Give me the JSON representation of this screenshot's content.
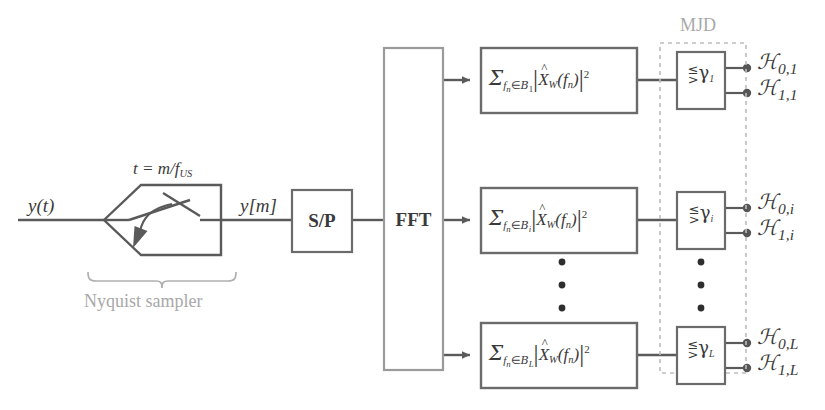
{
  "diagram": {
    "colors": {
      "line": "#5a5a5a",
      "box_border": "#6b6b6b",
      "text": "#3a3a3a",
      "gray_label": "#a8a8a8",
      "dashed_border": "#bdbdbd",
      "background": "#ffffff"
    }
  },
  "input": {
    "signal_label": "y(t)",
    "sampled_label": "y[m]",
    "sampling_relation": "t = m/f",
    "sampling_relation_sub": "US",
    "bracket_label": "Nyquist sampler"
  },
  "blocks": {
    "sp": "S/P",
    "fft": "FFT"
  },
  "mjd": {
    "label": "MJD"
  },
  "branches": [
    {
      "id": "branch-1",
      "index_symbol": "1",
      "energy": {
        "sigma": "Σ",
        "sum_var": "f",
        "sum_var_sub": "n",
        "member": "∈",
        "band_set": "B",
        "band_sub": "1",
        "magnitude_open": "|",
        "spectrum": "X",
        "spectrum_hat": "̂",
        "spectrum_sub": "W",
        "arg_open": "(",
        "arg": "f",
        "arg_sub": "n",
        "arg_close": ")",
        "magnitude_close": "|",
        "exponent": "2"
      },
      "threshold": {
        "cmp_top": "≤",
        "cmp_bottom": ">",
        "gamma": "γ",
        "gamma_sub": "1"
      },
      "outputs": [
        {
          "symbol": "ℋ",
          "sub": "0,1"
        },
        {
          "symbol": "ℋ",
          "sub": "1,1"
        }
      ]
    },
    {
      "id": "branch-i",
      "index_symbol": "i",
      "energy": {
        "sigma": "Σ",
        "sum_var": "f",
        "sum_var_sub": "n",
        "member": "∈",
        "band_set": "B",
        "band_sub": "i",
        "magnitude_open": "|",
        "spectrum": "X",
        "spectrum_hat": "̂",
        "spectrum_sub": "W",
        "arg_open": "(",
        "arg": "f",
        "arg_sub": "n",
        "arg_close": ")",
        "magnitude_close": "|",
        "exponent": "2"
      },
      "threshold": {
        "cmp_top": "≤",
        "cmp_bottom": ">",
        "gamma": "γ",
        "gamma_sub": "i"
      },
      "outputs": [
        {
          "symbol": "ℋ",
          "sub": "0,i"
        },
        {
          "symbol": "ℋ",
          "sub": "1,i"
        }
      ]
    },
    {
      "id": "branch-L",
      "index_symbol": "L",
      "energy": {
        "sigma": "Σ",
        "sum_var": "f",
        "sum_var_sub": "n",
        "member": "∈",
        "band_set": "B",
        "band_sub": "L",
        "magnitude_open": "|",
        "spectrum": "X",
        "spectrum_hat": "̂",
        "spectrum_sub": "W",
        "arg_open": "(",
        "arg": "f",
        "arg_sub": "n",
        "arg_close": ")",
        "magnitude_close": "|",
        "exponent": "2"
      },
      "threshold": {
        "cmp_top": "≤",
        "cmp_bottom": ">",
        "gamma": "γ",
        "gamma_sub": "L"
      },
      "outputs": [
        {
          "symbol": "ℋ",
          "sub": "0,L"
        },
        {
          "symbol": "ℋ",
          "sub": "1,L"
        }
      ]
    }
  ],
  "ellipsis": {
    "dot": "•",
    "count": 3
  }
}
